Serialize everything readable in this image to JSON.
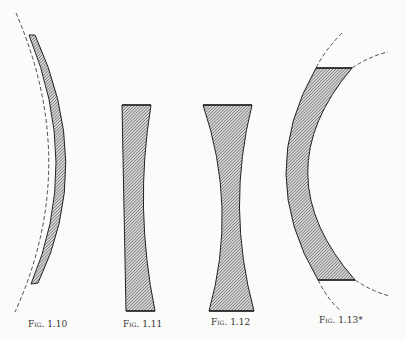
{
  "figures": [
    {
      "id": "fig-1-10",
      "caption": "Fig. 1.10",
      "shape": "meniscus lens (convex-concave, curved strip)"
    },
    {
      "id": "fig-1-11",
      "caption": "Fig. 1.11",
      "shape": "plano-concave lens"
    },
    {
      "id": "fig-1-12",
      "caption": "Fig. 1.12",
      "shape": "double-concave lens"
    },
    {
      "id": "fig-1-13",
      "caption": "Fig. 1.13*",
      "shape": "thick meniscus lens with dashed construction arcs"
    }
  ],
  "colors": {
    "ink": "#222222",
    "hatch": "#555555",
    "background": "#fbfbfa"
  }
}
